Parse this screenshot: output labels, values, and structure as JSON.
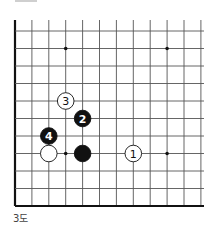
{
  "diagram": {
    "caption": "3도",
    "board": {
      "columns": 12,
      "rows": 11,
      "origin_x": 15,
      "origin_y": 31,
      "spacing_x": 16.9,
      "spacing_y": 17.5,
      "top_extend_y": 20,
      "right_extend_x": 204,
      "left_edge_thick": true,
      "bottom_edge_thick": true,
      "line_color": "#555555",
      "edge_color": "#111111"
    },
    "star_points": [
      {
        "col": 3,
        "row": 1
      },
      {
        "col": 9,
        "row": 1
      },
      {
        "col": 3,
        "row": 7
      },
      {
        "col": 9,
        "row": 7
      }
    ],
    "stones": [
      {
        "color": "white",
        "col": 2,
        "row": 7,
        "label": ""
      },
      {
        "color": "black",
        "col": 4,
        "row": 7,
        "label": ""
      },
      {
        "color": "white",
        "col": 7,
        "row": 7,
        "label": "1"
      },
      {
        "color": "black",
        "col": 4,
        "row": 5,
        "label": "2"
      },
      {
        "color": "white",
        "col": 3,
        "row": 4,
        "label": "3"
      },
      {
        "color": "black",
        "col": 2,
        "row": 6,
        "label": "4"
      }
    ]
  }
}
